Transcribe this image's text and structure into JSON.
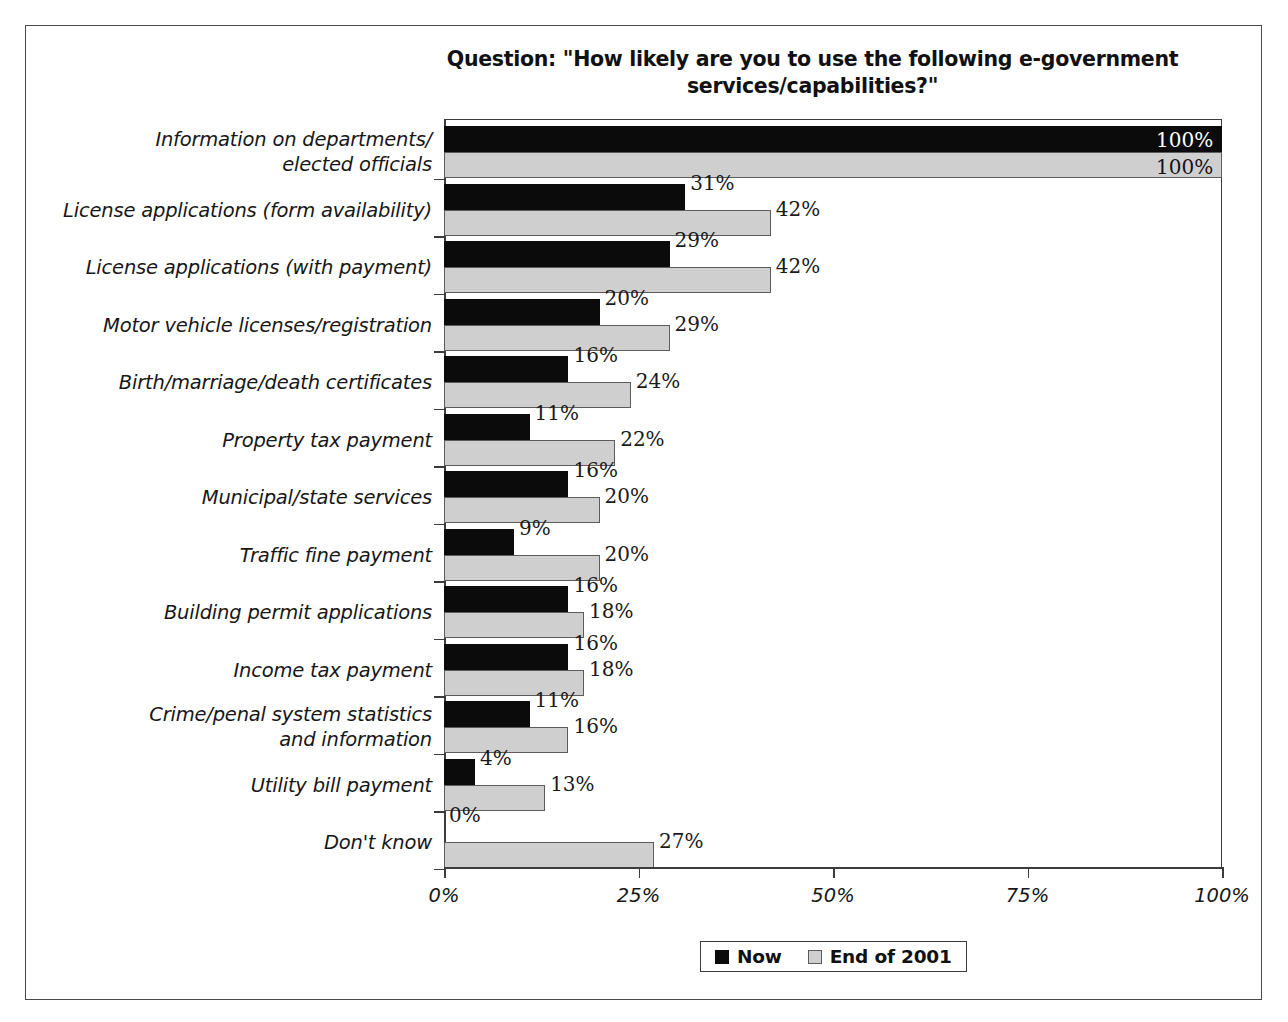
{
  "chart_data": {
    "type": "bar",
    "orientation": "horizontal",
    "title": "Question:  \"How likely are you to use the following e-government\nservices/capabilities?\"",
    "xlabel": "",
    "ylabel": "",
    "xlim": [
      0,
      100
    ],
    "grid": false,
    "legend_position": "bottom-center",
    "value_suffix": "%",
    "categories": [
      "Information on departments/\nelected officials",
      "License applications (form availability)",
      "License applications (with payment)",
      "Motor vehicle licenses/registration",
      "Birth/marriage/death certificates",
      "Property tax payment",
      "Municipal/state services",
      "Traffic fine payment",
      "Building permit applications",
      "Income tax payment",
      "Crime/penal system statistics\nand information",
      "Utility bill payment",
      "Don't know"
    ],
    "series": [
      {
        "name": "Now",
        "color": "#0b0b0b",
        "values": [
          100,
          31,
          29,
          20,
          16,
          11,
          16,
          9,
          16,
          16,
          11,
          4,
          0
        ],
        "labels": [
          "100%",
          "31%",
          "29%",
          "20%",
          "16%",
          "11%",
          "16%",
          "9%",
          "16%",
          "16%",
          "11%",
          "4%",
          "0%"
        ]
      },
      {
        "name": "End of 2001",
        "color": "#cfcfcf",
        "values": [
          100,
          42,
          42,
          29,
          24,
          22,
          20,
          20,
          18,
          18,
          16,
          13,
          27
        ],
        "labels": [
          "100%",
          "42%",
          "42%",
          "29%",
          "24%",
          "22%",
          "20%",
          "20%",
          "18%",
          "18%",
          "16%",
          "13%",
          "27%"
        ]
      }
    ],
    "xticks": [
      0,
      25,
      50,
      75,
      100
    ],
    "xtick_labels": [
      "0%",
      "25%",
      "50%",
      "75%",
      "100%"
    ]
  },
  "legend": {
    "items": [
      {
        "label": "Now",
        "swatch": "black-square-icon"
      },
      {
        "label": "End of 2001",
        "swatch": "gray-square-icon"
      }
    ]
  }
}
